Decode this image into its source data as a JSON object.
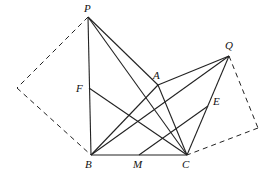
{
  "diagram": {
    "points": {
      "P": {
        "x": 88,
        "y": 17,
        "label": "P",
        "lx": 84,
        "ly": 12
      },
      "A": {
        "x": 158,
        "y": 85,
        "label": "A",
        "lx": 153,
        "ly": 79
      },
      "Q": {
        "x": 229,
        "y": 56,
        "label": "Q",
        "lx": 225,
        "ly": 49
      },
      "F": {
        "x": 89,
        "y": 88,
        "label": "F",
        "lx": 76,
        "ly": 92
      },
      "E": {
        "x": 208,
        "y": 106,
        "label": "E",
        "lx": 213,
        "ly": 105
      },
      "B": {
        "x": 91,
        "y": 155,
        "label": "B",
        "lx": 85,
        "ly": 168
      },
      "M": {
        "x": 139,
        "y": 155,
        "label": "M",
        "lx": 133,
        "ly": 168
      },
      "C": {
        "x": 187,
        "y": 155,
        "label": "C",
        "lx": 182,
        "ly": 168
      },
      "L": {
        "x": 17,
        "y": 88,
        "label": ""
      },
      "R": {
        "x": 258,
        "y": 128,
        "label": ""
      }
    },
    "solid_segments": [
      [
        "P",
        "B"
      ],
      [
        "P",
        "A"
      ],
      [
        "P",
        "C"
      ],
      [
        "A",
        "C"
      ],
      [
        "A",
        "Q"
      ],
      [
        "B",
        "A"
      ],
      [
        "B",
        "Q"
      ],
      [
        "B",
        "C"
      ],
      [
        "F",
        "C"
      ],
      [
        "M",
        "E"
      ],
      [
        "Q",
        "C"
      ]
    ],
    "dashed_segments": [
      [
        "P",
        "L"
      ],
      [
        "L",
        "B"
      ],
      [
        "Q",
        "R"
      ],
      [
        "R",
        "C"
      ]
    ]
  }
}
